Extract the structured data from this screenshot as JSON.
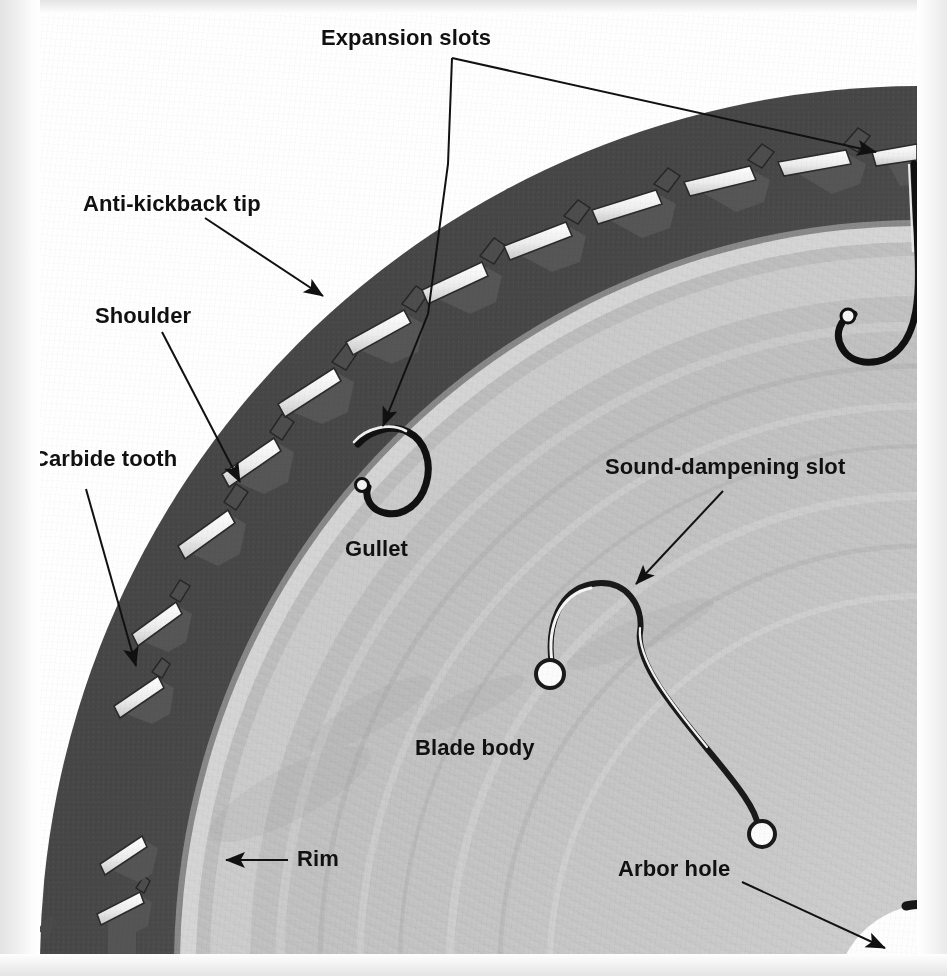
{
  "figure": {
    "view": "close-up photograph, upper-left quadrant of blade",
    "colors": {
      "paper_edge": "#e9e9e9",
      "photo_background": "#ffffff",
      "blade_rim_dark": "#585858",
      "blade_body_light": "#cfcfcf",
      "carbide_tip_white": "#f4f4f4",
      "label_text": "#111111",
      "leader_line": "#111111"
    }
  },
  "labels": [
    {
      "id": "expansion-slots",
      "text": "Expansion slots",
      "x": 321,
      "y": 27,
      "leader": "branching-two-arrows"
    },
    {
      "id": "anti-kickback-tip",
      "text": "Anti-kickback tip",
      "x": 83,
      "y": 193,
      "leader": "single-arrow-down-right"
    },
    {
      "id": "shoulder",
      "text": "Shoulder",
      "x": 95,
      "y": 305,
      "leader": "single-arrow-down-right"
    },
    {
      "id": "carbide-tooth",
      "text": "Carbide tooth",
      "x": 33,
      "y": 448,
      "leader": "single-arrow-down-right"
    },
    {
      "id": "gullet",
      "text": "Gullet",
      "x": 345,
      "y": 538,
      "leader": "none"
    },
    {
      "id": "sound-dampening-slot",
      "text": "Sound-dampening slot",
      "x": 605,
      "y": 456,
      "leader": "single-arrow-down-left"
    },
    {
      "id": "blade-body",
      "text": "Blade body",
      "x": 415,
      "y": 737,
      "leader": "none"
    },
    {
      "id": "rim",
      "text": "Rim",
      "x": 297,
      "y": 848,
      "leader": "single-arrow-left"
    },
    {
      "id": "arbor-hole",
      "text": "Arbor hole",
      "x": 618,
      "y": 858,
      "leader": "single-arrow-down-right"
    }
  ],
  "leaders": [
    {
      "id": "leader-expansion-slots-vertical",
      "points": "452,57 452,120 430,250 381,415",
      "arrow_at": "381,422",
      "arrow_dir": "down"
    },
    {
      "id": "leader-expansion-slots-diagonal",
      "points": "452,57 880,138",
      "arrow_at": "880,140",
      "arrow_dir": "right-down"
    },
    {
      "id": "leader-anti-kickback-tip",
      "points": "203,216 320,290",
      "arrow_at": "324,293",
      "arrow_dir": "down-right"
    },
    {
      "id": "leader-shoulder",
      "points": "160,330 239,478",
      "arrow_at": "241,483",
      "arrow_dir": "down-right"
    },
    {
      "id": "leader-carbide-tooth",
      "points": "84,487 133,662",
      "arrow_at": "135,668",
      "arrow_dir": "down-right"
    },
    {
      "id": "leader-sound-dampening-slot",
      "points": "720,488 632,578",
      "arrow_at": "628,582",
      "arrow_dir": "down-left"
    },
    {
      "id": "leader-rim",
      "points": "286,858 223,858",
      "arrow_at": "219,858",
      "arrow_dir": "left"
    },
    {
      "id": "leader-arbor-hole",
      "points": "740,880 880,945",
      "arrow_at": "885,948",
      "arrow_dir": "down-right"
    }
  ],
  "features": {
    "expansion_slots": {
      "count": 2,
      "description": "hook-shaped laser-cut slots extending inward from the gullet"
    },
    "sound_dampening_slot": {
      "count": 1,
      "description": "long S-curved slot with round ends in the blade body"
    },
    "arbor_hole": {
      "description": "central mounting hole, white circle at lower right"
    },
    "teeth": {
      "description": "carbide-tipped teeth with anti-kickback shoulders around the rim"
    }
  }
}
